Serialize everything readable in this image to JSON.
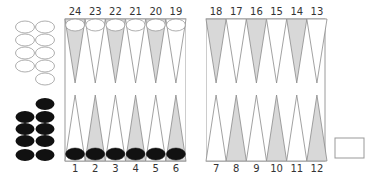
{
  "colors": {
    "board_border": "#9a9a9a",
    "point_dark": "#d8d8d8",
    "point_light": "#ffffff",
    "point_stroke": "#8a8a8a",
    "checker_black": "#111111",
    "checker_white_fill": "#ffffff",
    "checker_white_stroke": "#999999",
    "label": "#333333"
  },
  "board": {
    "top_labels": [
      "24",
      "23",
      "22",
      "21",
      "20",
      "19",
      "18",
      "17",
      "16",
      "15",
      "14",
      "13"
    ],
    "bottom_labels": [
      "1",
      "2",
      "3",
      "4",
      "5",
      "6",
      "7",
      "8",
      "9",
      "10",
      "11",
      "12"
    ],
    "top_shading": [
      "dark",
      "light",
      "dark",
      "light",
      "dark",
      "light",
      "dark",
      "light",
      "dark",
      "light",
      "dark",
      "light"
    ],
    "bottom_shading": [
      "light",
      "dark",
      "light",
      "dark",
      "light",
      "dark",
      "light",
      "dark",
      "light",
      "dark",
      "light",
      "dark"
    ]
  },
  "checkers_on_points": {
    "white": [
      24,
      23,
      22,
      21,
      20,
      19
    ],
    "black": [
      1,
      2,
      3,
      4,
      5,
      6
    ]
  },
  "borne_off": {
    "white_count": 9,
    "black_count": 9
  },
  "dice_box": {
    "label": ""
  }
}
